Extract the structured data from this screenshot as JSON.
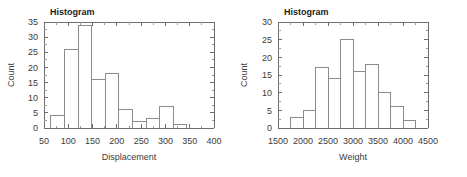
{
  "figure": {
    "background": "#ffffff",
    "panel_count": 2,
    "axis_color": "#6e6e6e",
    "bar_stroke_color": "#8c8c8c",
    "text_color": "#3b3b3b"
  },
  "chart_data": [
    {
      "type": "bar",
      "subtype": "histogram",
      "title": "Histogram",
      "xlabel": "Displacement",
      "ylabel": "Count",
      "xlim": [
        50,
        400
      ],
      "ylim": [
        0,
        35
      ],
      "xticks": [
        50,
        100,
        150,
        200,
        250,
        300,
        350,
        400
      ],
      "xtick_labels": [
        "50",
        "100",
        "150",
        "200",
        "250",
        "300",
        "350",
        "400"
      ],
      "yticks": [
        0,
        5,
        10,
        15,
        20,
        25,
        30,
        35
      ],
      "ytick_labels": [
        "0",
        "5",
        "10",
        "15",
        "20",
        "25",
        "30",
        "35"
      ],
      "bin_width": 28,
      "bin_edges": [
        64,
        92,
        120,
        148,
        176,
        204,
        232,
        260,
        288,
        316,
        344
      ],
      "categories": [
        "64-92",
        "92-120",
        "120-148",
        "148-176",
        "176-204",
        "204-232",
        "232-260",
        "260-288",
        "288-316",
        "316-344"
      ],
      "values": [
        4,
        26,
        34,
        16,
        18,
        6,
        2,
        3,
        7,
        1
      ],
      "grid": false,
      "legend": null,
      "minor_ticks": true,
      "top_axis": true,
      "right_axis": true
    },
    {
      "type": "bar",
      "subtype": "histogram",
      "title": "Histogram",
      "xlabel": "Weight",
      "ylabel": "Count",
      "xlim": [
        1500,
        4500
      ],
      "ylim": [
        0,
        30
      ],
      "xticks": [
        1500,
        2000,
        2500,
        3000,
        3500,
        4000,
        4500
      ],
      "xtick_labels": [
        "1500",
        "2000",
        "2500",
        "3000",
        "3500",
        "4000",
        "4500"
      ],
      "yticks": [
        0,
        5,
        10,
        15,
        20,
        25,
        30
      ],
      "ytick_labels": [
        "0",
        "5",
        "10",
        "15",
        "20",
        "25",
        "30"
      ],
      "bin_width": 250,
      "bin_edges": [
        1750,
        2000,
        2250,
        2500,
        2750,
        3000,
        3250,
        3500,
        3750,
        4000,
        4250
      ],
      "categories": [
        "1750-2000",
        "2000-2250",
        "2250-2500",
        "2500-2750",
        "2750-3000",
        "3000-3250",
        "3250-3500",
        "3500-3750",
        "3750-4000",
        "4000-4250"
      ],
      "values": [
        3,
        5,
        17,
        14,
        25,
        16,
        18,
        10,
        6,
        2
      ],
      "grid": false,
      "legend": null,
      "minor_ticks": true,
      "top_axis": true,
      "right_axis": true
    }
  ]
}
